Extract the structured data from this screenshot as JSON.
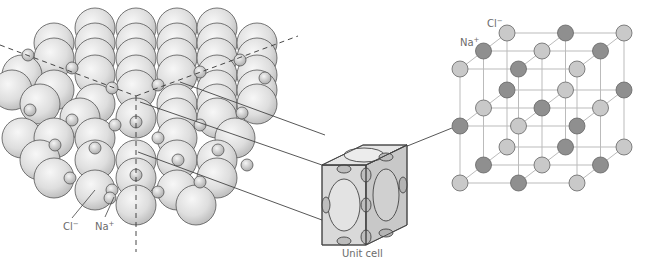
{
  "figure": {
    "colors": {
      "background": "#ffffff",
      "large_sphere": "#e2e2e2",
      "small_sphere": "#d8d8d8",
      "sphere_outline": "#555555",
      "cl_node": "#c9c9c9",
      "na_node": "#8f8f8f",
      "lattice_line": "#bbbbbb",
      "label_text": "#6b6b6b",
      "leader_line": "#444444"
    }
  },
  "packing_model": {
    "labels": {
      "cl": "Cl",
      "cl_charge": "−",
      "na": "Na",
      "na_charge": "+"
    }
  },
  "unit_cell": {
    "caption": "Unit cell"
  },
  "lattice_model": {
    "labels": {
      "cl": "Cl",
      "cl_charge": "−",
      "na": "Na",
      "na_charge": "+"
    },
    "grid": "3x3x3",
    "layers": [
      {
        "rows": [
          [
            "Cl",
            "Na",
            "Cl"
          ],
          [
            "Na",
            "Cl",
            "Na"
          ],
          [
            "Cl",
            "Na",
            "Cl"
          ]
        ]
      },
      {
        "rows": [
          [
            "Na",
            "Cl",
            "Na"
          ],
          [
            "Cl",
            "Na",
            "Cl"
          ],
          [
            "Na",
            "Cl",
            "Na"
          ]
        ]
      },
      {
        "rows": [
          [
            "Cl",
            "Na",
            "Cl"
          ],
          [
            "Na",
            "Cl",
            "Na"
          ],
          [
            "Cl",
            "Na",
            "Cl"
          ]
        ]
      }
    ]
  }
}
